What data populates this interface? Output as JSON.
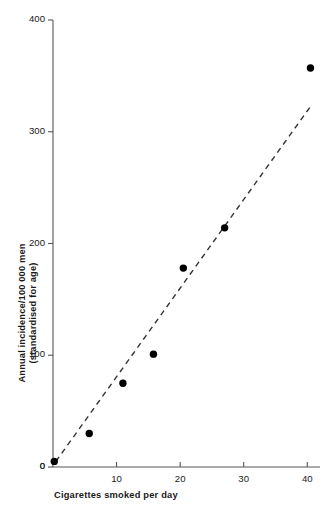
{
  "chart_data": {
    "type": "scatter",
    "title": "",
    "xlabel": "Cigarettes smoked per day",
    "ylabel_line1": "Annual incidence/100 000 men",
    "ylabel_line2": "(standardised for age)",
    "xlim": [
      0,
      42
    ],
    "ylim": [
      0,
      400
    ],
    "xticks": [
      0,
      10,
      20,
      30,
      40
    ],
    "xtick_labels": [
      "0",
      "10",
      "20",
      "30",
      "40"
    ],
    "yticks": [
      0,
      100,
      200,
      300,
      400
    ],
    "ytick_labels": [
      "0",
      "100",
      "200",
      "300",
      "400"
    ],
    "grid": false,
    "legend": "none",
    "marker_color": "#000000",
    "line_color": "#333333",
    "axis_color": "#555555",
    "points": [
      {
        "x": 0.2,
        "y": 5
      },
      {
        "x": 5.7,
        "y": 30
      },
      {
        "x": 11.0,
        "y": 75
      },
      {
        "x": 15.8,
        "y": 101
      },
      {
        "x": 20.5,
        "y": 178
      },
      {
        "x": 27.0,
        "y": 214
      },
      {
        "x": 40.5,
        "y": 357
      }
    ],
    "trend_line": {
      "style": "dashed",
      "x_start": 0.45,
      "y_start": 5,
      "x_end": 40.8,
      "y_end": 325
    }
  }
}
